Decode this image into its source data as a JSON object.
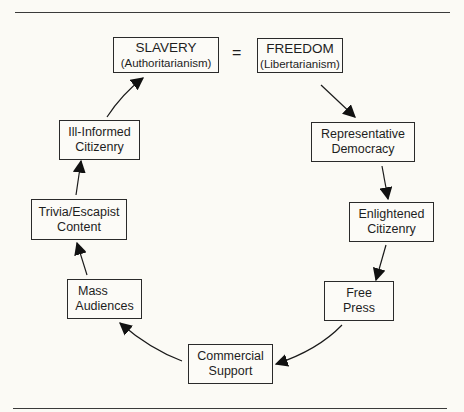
{
  "diagram": {
    "type": "cycle-flowchart",
    "top_left_pair": {
      "left": {
        "line1": "SLAVERY",
        "line2": "(Authoritarianism)"
      },
      "relation": "=",
      "right": {
        "line1": "FREEDOM",
        "line2": "(Libertarianism)"
      }
    },
    "nodes": [
      {
        "id": "slavery",
        "line1": "SLAVERY",
        "line2": "(Authoritarianism)"
      },
      {
        "id": "freedom",
        "line1": "FREEDOM",
        "line2": "(Libertarianism)"
      },
      {
        "id": "rep_democracy",
        "line1": "Representative",
        "line2": "Democracy"
      },
      {
        "id": "enlightened",
        "line1": "Enlightened",
        "line2": "Citizenry"
      },
      {
        "id": "free_press",
        "line1": "Free",
        "line2": "Press"
      },
      {
        "id": "commercial",
        "line1": "Commercial",
        "line2": "Support"
      },
      {
        "id": "mass_aud",
        "line1": "Mass",
        "line2": "Audiences"
      },
      {
        "id": "trivia",
        "line1": "Trivia/Escapist",
        "line2": "Content"
      },
      {
        "id": "ill_informed",
        "line1": "Ill-Informed",
        "line2": "Citizenry"
      }
    ],
    "edges": [
      {
        "from": "freedom",
        "to": "rep_democracy"
      },
      {
        "from": "rep_democracy",
        "to": "enlightened"
      },
      {
        "from": "enlightened",
        "to": "free_press"
      },
      {
        "from": "free_press",
        "to": "commercial"
      },
      {
        "from": "commercial",
        "to": "mass_aud"
      },
      {
        "from": "mass_aud",
        "to": "trivia"
      },
      {
        "from": "trivia",
        "to": "ill_informed"
      },
      {
        "from": "ill_informed",
        "to": "slavery"
      }
    ],
    "equals_symbol": "="
  }
}
